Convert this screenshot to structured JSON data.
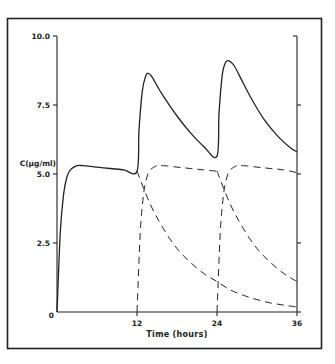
{
  "chart_data": {
    "type": "line",
    "title": "",
    "xlabel": "Time (hours)",
    "ylabel": "C(µg/ml)",
    "xlim": [
      0,
      36
    ],
    "ylim": [
      0,
      10
    ],
    "x_ticks": [
      "0",
      "12",
      "24",
      "36"
    ],
    "x_tick_values": [
      0,
      12,
      24,
      36
    ],
    "y_ticks": [
      "0",
      "2.5",
      "5.0",
      "7.5",
      "10.0"
    ],
    "y_tick_values": [
      0,
      2.5,
      5.0,
      7.5,
      10.0
    ],
    "grid": false,
    "legend": null,
    "series": [
      {
        "name": "Total concentration (superposition)",
        "style": "solid",
        "x": [
          0,
          0.5,
          1,
          1.5,
          2,
          3,
          4,
          6,
          8,
          10,
          12,
          12.3,
          12.8,
          13.3,
          13.7,
          14.3,
          15,
          16,
          18,
          20,
          22,
          24,
          24.3,
          24.8,
          25.3,
          25.8,
          26.5,
          27.5,
          29,
          31,
          33,
          35,
          36
        ],
        "values": [
          0,
          2.9,
          4.3,
          4.9,
          5.15,
          5.3,
          5.3,
          5.25,
          5.2,
          5.15,
          5.1,
          6.6,
          8.0,
          8.55,
          8.65,
          8.5,
          8.2,
          7.8,
          7.1,
          6.5,
          6.0,
          5.65,
          7.2,
          8.6,
          9.05,
          9.1,
          8.95,
          8.5,
          7.8,
          7.0,
          6.4,
          5.95,
          5.8
        ]
      },
      {
        "name": "Dose 1 decay (after 12 h)",
        "style": "dashed",
        "x": [
          12,
          14,
          16,
          18,
          20,
          22,
          24,
          26,
          28,
          30,
          32,
          34,
          36
        ],
        "values": [
          5.1,
          3.9,
          3.0,
          2.3,
          1.8,
          1.4,
          1.1,
          0.8,
          0.6,
          0.45,
          0.33,
          0.25,
          0.18
        ]
      },
      {
        "name": "Dose 2 rise",
        "style": "dashed",
        "x": [
          12,
          12.5,
          13,
          13.5,
          14,
          15,
          16,
          18,
          20,
          22,
          24
        ],
        "values": [
          0,
          2.9,
          4.3,
          4.9,
          5.15,
          5.3,
          5.3,
          5.25,
          5.2,
          5.15,
          5.1
        ]
      },
      {
        "name": "Dose 2 decay (after 24 h)",
        "style": "dashed",
        "x": [
          24,
          26,
          28,
          30,
          32,
          34,
          36
        ],
        "values": [
          5.1,
          3.9,
          3.0,
          2.3,
          1.8,
          1.4,
          1.1
        ]
      },
      {
        "name": "Dose 3 rise",
        "style": "dashed",
        "x": [
          24,
          24.5,
          25,
          25.5,
          26,
          27,
          28,
          30,
          32,
          34,
          36
        ],
        "values": [
          0,
          2.9,
          4.3,
          4.9,
          5.15,
          5.3,
          5.3,
          5.25,
          5.2,
          5.15,
          5.05
        ]
      }
    ]
  },
  "labels": {
    "ylabel": "C(µg/ml)",
    "xlabel": "Time (hours)",
    "y_ticks": [
      "0",
      "2.5",
      "5.0",
      "7.5",
      "10.0"
    ],
    "x_ticks": [
      "0",
      "12",
      "24",
      "36"
    ]
  },
  "style": {
    "ink": "#222222",
    "background": "#ffffff"
  }
}
